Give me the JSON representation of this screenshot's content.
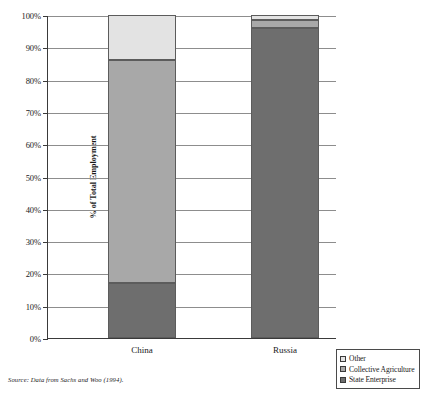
{
  "chart_data": {
    "type": "bar",
    "subtype": "stacked-100-percent",
    "title": "",
    "xlabel": "",
    "ylabel": "% of Total Employment",
    "categories": [
      "China",
      "Russia"
    ],
    "ylim": [
      0,
      100
    ],
    "yticks": [
      0,
      10,
      20,
      30,
      40,
      50,
      60,
      70,
      80,
      90,
      100
    ],
    "ytick_labels": [
      "0%",
      "10%",
      "20%",
      "30%",
      "40%",
      "50%",
      "60%",
      "70%",
      "80%",
      "90%",
      "100%"
    ],
    "grid": true,
    "legend_position": "bottom-right",
    "stack_order_bottom_to_top": [
      "State Enterprise",
      "Collective Agriculture",
      "Other"
    ],
    "series": [
      {
        "name": "State Enterprise",
        "color": "#6e6e6e",
        "values": [
          17,
          96
        ]
      },
      {
        "name": "Collective Agriculture",
        "color": "#a8a8a8",
        "values": [
          69,
          2.5
        ]
      },
      {
        "name": "Other",
        "color": "#e3e3e3",
        "values": [
          14,
          1.5
        ]
      }
    ],
    "cumulative_tops": {
      "China": {
        "State Enterprise": 17,
        "Collective Agriculture": 86,
        "Other": 100
      },
      "Russia": {
        "State Enterprise": 96,
        "Collective Agriculture": 98.5,
        "Other": 100
      }
    },
    "source_note": "Source: Data from Sachs and Woo (1994)."
  },
  "axis": {
    "ylabel": "% of Total Employment",
    "ytick_labels": [
      "100%",
      "90%",
      "80%",
      "70%",
      "60%",
      "50%",
      "40%",
      "30%",
      "20%",
      "10%",
      "0%"
    ]
  },
  "bars": {
    "china": {
      "label": "China"
    },
    "russia": {
      "label": "Russia"
    }
  },
  "legend": {
    "items": [
      {
        "label": "Other",
        "color": "#e3e3e3"
      },
      {
        "label": "Collective Agriculture",
        "color": "#a8a8a8"
      },
      {
        "label": "State Enterprise",
        "color": "#6e6e6e"
      }
    ]
  },
  "footer": {
    "source": "Source: Data from Sachs and Woo (1994)."
  }
}
